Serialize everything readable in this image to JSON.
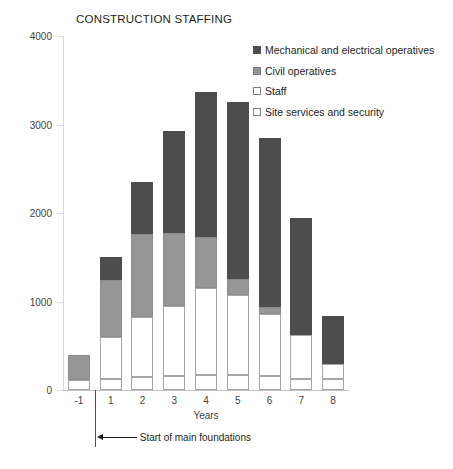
{
  "chart_data": {
    "type": "bar",
    "stacked": true,
    "title": "CONSTRUCTION STAFFING",
    "xlabel": "Years",
    "ylabel": "",
    "ylim": [
      0,
      4000
    ],
    "yticks": [
      0,
      1000,
      2000,
      3000,
      4000
    ],
    "ytick_labels": [
      "0",
      "1000",
      "2000",
      "3000",
      "4000"
    ],
    "grid": false,
    "legend_position": "top-right",
    "categories": [
      "-1",
      "1",
      "2",
      "3",
      "4",
      "5",
      "6",
      "7",
      "8"
    ],
    "series": [
      {
        "name": "Site services and security",
        "color": "#ffffff",
        "values": [
          110,
          120,
          150,
          160,
          170,
          170,
          160,
          130,
          120
        ]
      },
      {
        "name": "Staff",
        "color": "#ffffff",
        "values": [
          0,
          480,
          670,
          790,
          980,
          900,
          700,
          490,
          170
        ]
      },
      {
        "name": "Civil operatives",
        "color": "#969696",
        "values": [
          290,
          640,
          940,
          820,
          580,
          180,
          80,
          0,
          0
        ]
      },
      {
        "name": "Mechanical and electrical operatives",
        "color": "#4d4d4d",
        "values": [
          0,
          260,
          590,
          1160,
          1640,
          2000,
          1910,
          1320,
          550
        ]
      }
    ],
    "totals": [
      400,
      1500,
      2350,
      2930,
      3370,
      3250,
      2850,
      1940,
      840
    ],
    "annotations": [
      {
        "text": "Start of main foundations",
        "type": "arrow-left",
        "at_category": "-1/1 boundary"
      }
    ]
  },
  "legend": {
    "items": [
      {
        "label": "Mechanical and electrical operatives",
        "swatch": "mech"
      },
      {
        "label": "Civil operatives",
        "swatch": "civil"
      },
      {
        "label": "Staff",
        "swatch": "staff"
      },
      {
        "label": "Site services and security",
        "swatch": "site"
      }
    ]
  }
}
